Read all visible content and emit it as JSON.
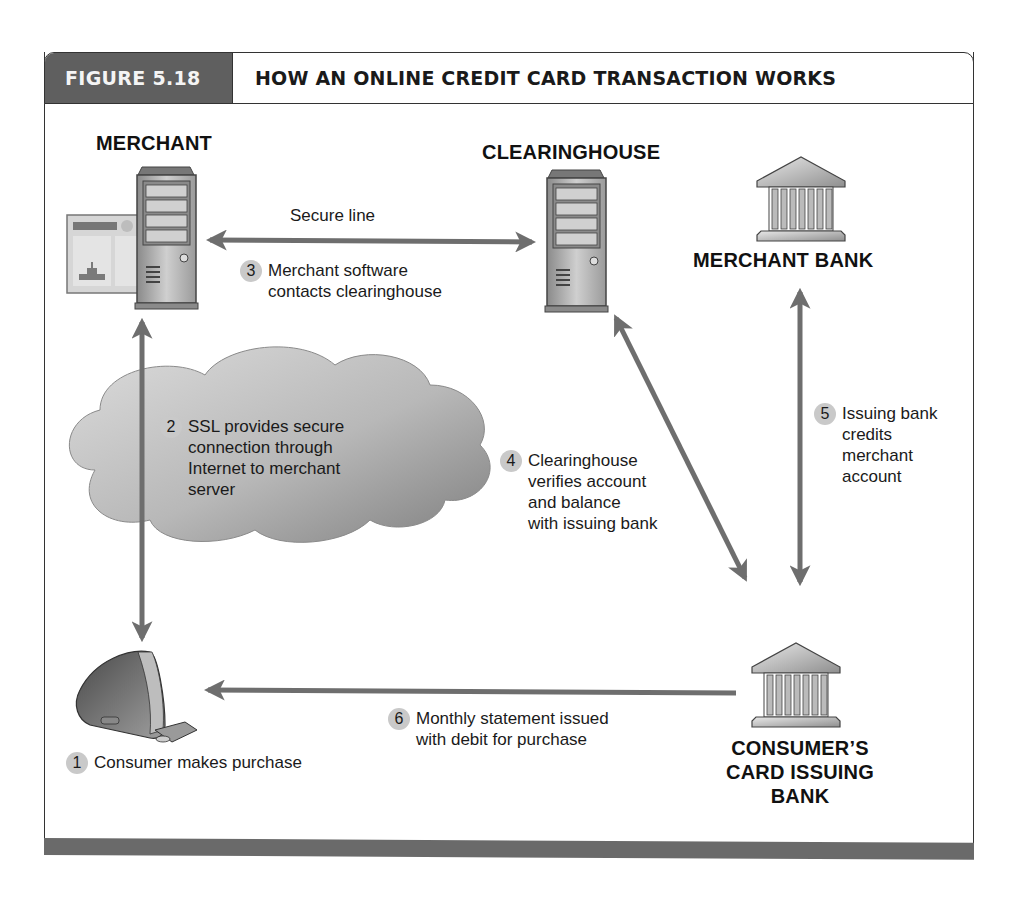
{
  "figure": {
    "label": "FIGURE 5.18",
    "title": "HOW AN ONLINE CREDIT CARD TRANSACTION WORKS"
  },
  "nodes": {
    "merchant": {
      "label": "MERCHANT",
      "icon": "server-with-webpage-icon"
    },
    "clearinghouse": {
      "label": "CLEARINGHOUSE",
      "icon": "server-icon"
    },
    "merchant_bank": {
      "label": "MERCHANT BANK",
      "icon": "bank-building-icon"
    },
    "consumer_bank": {
      "label_lines": [
        "CONSUMER’S",
        "CARD ISSUING",
        "BANK"
      ],
      "icon": "bank-building-icon"
    },
    "consumer": {
      "icon": "desktop-computer-icon"
    },
    "internet": {
      "icon": "cloud-icon"
    }
  },
  "edges": {
    "secure_line_label": "Secure line"
  },
  "steps": [
    {
      "num": "1",
      "lines": [
        "Consumer makes purchase"
      ]
    },
    {
      "num": "2",
      "lines": [
        "SSL provides secure",
        "connection through",
        "Internet to merchant",
        "server"
      ]
    },
    {
      "num": "3",
      "lines": [
        "Merchant software",
        "contacts clearinghouse"
      ]
    },
    {
      "num": "4",
      "lines": [
        "Clearinghouse",
        "verifies account",
        "and balance",
        "with issuing bank"
      ]
    },
    {
      "num": "5",
      "lines": [
        "Issuing bank",
        "credits",
        "merchant",
        "account"
      ]
    },
    {
      "num": "6",
      "lines": [
        "Monthly statement issued",
        "with debit for purchase"
      ]
    }
  ],
  "colors": {
    "header_fill": "#5f5f5f",
    "arrow": "#6e6e6e",
    "badge": "#c9c9c9",
    "cloud": "#b5b5b5",
    "bottom_bar": "#6a6a6a"
  }
}
